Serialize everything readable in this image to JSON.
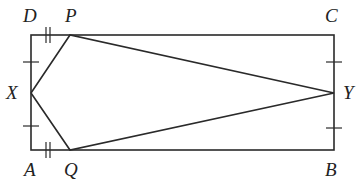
{
  "diagram": {
    "type": "geometry",
    "stroke_color": "#2a2a2a",
    "labels": {
      "D": "D",
      "P": "P",
      "C": "C",
      "X": "X",
      "Y": "Y",
      "A": "A",
      "Q": "Q",
      "B": "B"
    },
    "points": {
      "A": [
        31,
        150
      ],
      "B": [
        334,
        150
      ],
      "C": [
        334,
        35
      ],
      "D": [
        31,
        35
      ],
      "P": [
        70,
        35
      ],
      "Q": [
        70,
        150
      ],
      "X": [
        31,
        93
      ],
      "Y": [
        334,
        93
      ]
    },
    "tick_marks": {
      "single": [
        "DX",
        "XA",
        "CY",
        "YB"
      ],
      "double": [
        "DP",
        "AQ"
      ]
    },
    "segments": [
      "AB",
      "BC",
      "CD",
      "DA",
      "XP",
      "PY",
      "YQ",
      "QX"
    ]
  }
}
